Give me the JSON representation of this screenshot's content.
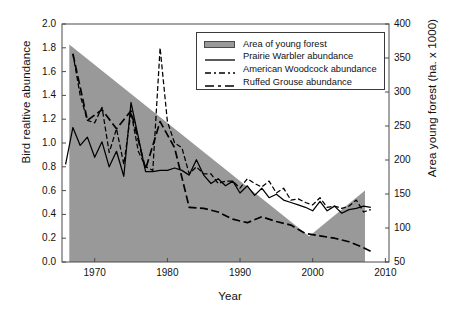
{
  "chart_data": {
    "type": "area",
    "title": "",
    "xlabel": "Year",
    "ylabel": "Bird realtive abundance",
    "ylabel_right": "Area young forest (ha. x 1000)",
    "xlim": [
      1965.5,
      2010.5
    ],
    "ylim": [
      0.0,
      2.0
    ],
    "ylim_right": [
      50,
      400
    ],
    "grid": false,
    "legend_position": "top-center",
    "xticks": [
      "1970",
      "1980",
      "1990",
      "2000",
      "2010"
    ],
    "xtick_values": [
      1970,
      1980,
      1990,
      2000,
      2010
    ],
    "yticks_left": [
      "0.0",
      "0.2",
      "0.4",
      "0.6",
      "0.8",
      "1.0",
      "1.2",
      "1.4",
      "1.6",
      "1.8",
      "2.0"
    ],
    "ytick_values_left": [
      0.0,
      0.2,
      0.4,
      0.6,
      0.8,
      1.0,
      1.2,
      1.4,
      1.6,
      1.8,
      2.0
    ],
    "yticks_right": [
      "50",
      "100",
      "150",
      "200",
      "250",
      "300",
      "350",
      "400"
    ],
    "ytick_values_right": [
      50,
      100,
      150,
      200,
      250,
      300,
      350,
      400
    ],
    "legend": [
      {
        "label": "Area of young forest",
        "style": "area",
        "color": "#999999"
      },
      {
        "label": "Prairie Warbler abundance",
        "style": "solid",
        "color": "#000000"
      },
      {
        "label": "American Woodcock abundance",
        "style": "dashed",
        "color": "#000000"
      },
      {
        "label": "Ruffed Grouse abundance",
        "style": "long-dash",
        "color": "#000000"
      }
    ],
    "series": [
      {
        "name": "Area of young forest",
        "axis": "right",
        "type": "area",
        "x": [
          1966.5,
          1999.5,
          2007.2,
          2007.2
        ],
        "values": [
          370,
          88,
          155,
          50
        ]
      },
      {
        "name": "Prairie Warbler abundance",
        "axis": "left",
        "type": "line",
        "x": [
          1966,
          1967,
          1968,
          1969,
          1970,
          1971,
          1972,
          1973,
          1974,
          1975,
          1976,
          1977,
          1978,
          1979,
          1980,
          1981,
          1982,
          1983,
          1984,
          1985,
          1986,
          1987,
          1988,
          1989,
          1990,
          1991,
          1992,
          1993,
          1994,
          1995,
          1996,
          1997,
          1998,
          1999,
          2000,
          2001,
          2002,
          2003,
          2004,
          2005,
          2006,
          2007,
          2008
        ],
        "values": [
          0.82,
          1.13,
          0.98,
          1.05,
          0.88,
          1.01,
          0.8,
          0.93,
          0.72,
          1.34,
          1.05,
          0.76,
          0.76,
          0.77,
          0.77,
          0.79,
          0.77,
          0.73,
          0.86,
          0.73,
          0.66,
          0.7,
          0.64,
          0.68,
          0.58,
          0.64,
          0.56,
          0.62,
          0.54,
          0.57,
          0.52,
          0.5,
          0.48,
          0.46,
          0.43,
          0.51,
          0.43,
          0.47,
          0.41,
          0.44,
          0.45,
          0.47,
          0.46
        ]
      },
      {
        "name": "American Woodcock abundance",
        "axis": "left",
        "type": "line",
        "x": [
          1967,
          1968,
          1969,
          1970,
          1971,
          1972,
          1973,
          1974,
          1975,
          1976,
          1977,
          1978,
          1979,
          1980,
          1981,
          1982,
          1983,
          1984,
          1985,
          1986,
          1987,
          1988,
          1989,
          1990,
          1991,
          1992,
          1993,
          1994,
          1995,
          1996,
          1997,
          1998,
          1999,
          2000,
          2001,
          2002,
          2003,
          2004,
          2005,
          2006,
          2007,
          2008
        ],
        "values": [
          1.75,
          1.4,
          1.19,
          1.17,
          1.3,
          0.92,
          1.12,
          0.82,
          1.26,
          0.93,
          0.8,
          0.77,
          1.8,
          1.18,
          1.0,
          0.96,
          0.74,
          0.8,
          0.74,
          0.74,
          0.66,
          0.68,
          0.68,
          0.62,
          0.7,
          0.66,
          0.63,
          0.68,
          0.58,
          0.62,
          0.52,
          0.53,
          0.5,
          0.48,
          0.54,
          0.46,
          0.47,
          0.45,
          0.47,
          0.52,
          0.42,
          0.44
        ]
      },
      {
        "name": "Ruffed Grouse abundance",
        "axis": "left",
        "type": "line",
        "x": [
          1967,
          1969,
          1971,
          1973,
          1975,
          1977,
          1979,
          1981,
          1983,
          1985,
          1987,
          1989,
          1991,
          1993,
          1995,
          1997,
          1999,
          2001,
          2003,
          2005,
          2007,
          2008
        ],
        "values": [
          1.75,
          1.19,
          1.28,
          1.12,
          1.27,
          0.78,
          1.18,
          0.96,
          0.46,
          0.45,
          0.42,
          0.36,
          0.33,
          0.38,
          0.34,
          0.31,
          0.24,
          0.22,
          0.2,
          0.17,
          0.12,
          0.09
        ]
      }
    ]
  }
}
